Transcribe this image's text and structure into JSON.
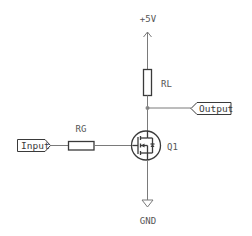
{
  "diagram": {
    "power": {
      "label": "+5V",
      "symbol": "power-arrow-icon"
    },
    "ground": {
      "label": "GND",
      "symbol": "ground-icon"
    },
    "components": [
      {
        "ref": "RL",
        "type": "resistor",
        "orientation": "vertical"
      },
      {
        "ref": "RG",
        "type": "resistor",
        "orientation": "horizontal"
      },
      {
        "ref": "Q1",
        "type": "n-channel-mosfet"
      }
    ],
    "ports": {
      "input": {
        "label": "Input",
        "direction": "in"
      },
      "output": {
        "label": "Output",
        "direction": "out"
      }
    },
    "nets": [
      {
        "from": "+5V",
        "to": "RL"
      },
      {
        "from": "RL",
        "to": "Q1.drain",
        "junction": "Output"
      },
      {
        "from": "Input",
        "to": "RG"
      },
      {
        "from": "RG",
        "to": "Q1.gate"
      },
      {
        "from": "Q1.source",
        "to": "GND"
      }
    ],
    "colors": {
      "wire": "#7a7a7a",
      "component": "#3a3a3a",
      "text": "#555555",
      "junction": "#8a8a8a"
    }
  }
}
